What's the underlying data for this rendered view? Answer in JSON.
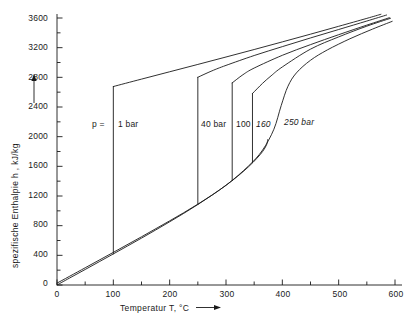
{
  "chart_data": {
    "type": "line",
    "title": "",
    "xlabel": "Temperatur T, °C",
    "ylabel": "spezifische Enthalpie  h , kJ/kg",
    "xlim": [
      0,
      600
    ],
    "ylim": [
      0,
      3600
    ],
    "grid": false,
    "legend_position": "inline-annotations",
    "x_ticks": [
      "0",
      "100",
      "200",
      "300",
      "400",
      "500",
      "600"
    ],
    "x_tick_values": [
      0,
      100,
      200,
      300,
      400,
      500,
      600
    ],
    "x_minor_tick_values": [
      50,
      150,
      250,
      350,
      450,
      550
    ],
    "y_ticks": [
      "0",
      "400",
      "800",
      "1200",
      "1600",
      "2000",
      "2400",
      "2800",
      "3200",
      "3600"
    ],
    "y_tick_values": [
      0,
      400,
      800,
      1200,
      1600,
      2000,
      2400,
      2800,
      3200,
      3600
    ],
    "y_minor_tick_values": [
      200,
      600,
      1000,
      1400,
      1800,
      2200,
      2600,
      3000,
      3400
    ],
    "annotations": [
      {
        "name": "p-equals-label",
        "text": "p =",
        "x": 70,
        "y": 2180
      },
      {
        "name": "isobar-label-1bar",
        "text": "1 bar",
        "x": 120,
        "y": 2180
      },
      {
        "name": "isobar-label-40bar",
        "text": "40 bar",
        "x": 258,
        "y": 2180
      },
      {
        "name": "isobar-label-100bar",
        "text": "100",
        "x": 312,
        "y": 2180
      },
      {
        "name": "isobar-label-160bar",
        "text": "160",
        "x": 345,
        "y": 2180
      },
      {
        "name": "isobar-label-250bar",
        "text": "250 bar",
        "x": 392,
        "y": 2180
      }
    ],
    "series": [
      {
        "name": "saturated liquid line (Siedelinie)",
        "pressure_bar": null,
        "points": [
          [
            0,
            0
          ],
          [
            25,
            105
          ],
          [
            50,
            209
          ],
          [
            75,
            314
          ],
          [
            100,
            419
          ],
          [
            125,
            525
          ],
          [
            150,
            632
          ],
          [
            175,
            741
          ],
          [
            200,
            852
          ],
          [
            225,
            966
          ],
          [
            250,
            1085
          ],
          [
            275,
            1210
          ],
          [
            300,
            1344
          ],
          [
            320,
            1462
          ],
          [
            340,
            1594
          ],
          [
            355,
            1710
          ],
          [
            365,
            1800
          ],
          [
            372,
            1890
          ],
          [
            374,
            1960
          ]
        ]
      },
      {
        "name": "isobar 1 bar (superheated vapour)",
        "pressure_bar": 1,
        "points": [
          [
            100,
            2676
          ],
          [
            150,
            2776
          ],
          [
            200,
            2875
          ],
          [
            250,
            2974
          ],
          [
            300,
            3074
          ],
          [
            350,
            3175
          ],
          [
            400,
            3278
          ],
          [
            450,
            3382
          ],
          [
            500,
            3488
          ],
          [
            550,
            3595
          ],
          [
            575,
            3650
          ]
        ]
      },
      {
        "name": "isobar 1 bar (evaporation, vertical)",
        "pressure_bar": 1,
        "points": [
          [
            100,
            419
          ],
          [
            100,
            2676
          ]
        ]
      },
      {
        "name": "isobar 40 bar (superheated vapour)",
        "pressure_bar": 40,
        "points": [
          [
            250,
            2801
          ],
          [
            275,
            2887
          ],
          [
            300,
            2961
          ],
          [
            350,
            3094
          ],
          [
            400,
            3214
          ],
          [
            450,
            3331
          ],
          [
            500,
            3445
          ],
          [
            550,
            3559
          ],
          [
            585,
            3640
          ]
        ]
      },
      {
        "name": "isobar 40 bar (evaporation, vertical)",
        "pressure_bar": 40,
        "points": [
          [
            250,
            1087
          ],
          [
            250,
            2801
          ]
        ]
      },
      {
        "name": "isobar 100 bar (superheated vapour)",
        "pressure_bar": 100,
        "points": [
          [
            311,
            2725
          ],
          [
            330,
            2835
          ],
          [
            350,
            2925
          ],
          [
            400,
            3097
          ],
          [
            450,
            3241
          ],
          [
            500,
            3375
          ],
          [
            550,
            3504
          ],
          [
            590,
            3604
          ]
        ]
      },
      {
        "name": "isobar 100 bar (evaporation, vertical)",
        "pressure_bar": 100,
        "points": [
          [
            311,
            1408
          ],
          [
            311,
            2725
          ]
        ]
      },
      {
        "name": "isobar 160 bar (superheated vapour)",
        "pressure_bar": 160,
        "points": [
          [
            347,
            2582
          ],
          [
            365,
            2720
          ],
          [
            380,
            2820
          ],
          [
            400,
            2940
          ],
          [
            450,
            3180
          ],
          [
            500,
            3345
          ],
          [
            550,
            3490
          ],
          [
            592,
            3596
          ]
        ]
      },
      {
        "name": "isobar 160 bar (evaporation, vertical)",
        "pressure_bar": 160,
        "points": [
          [
            347,
            1650
          ],
          [
            347,
            2582
          ]
        ]
      },
      {
        "name": "isobar 250 bar (supercritical)",
        "pressure_bar": 250,
        "points": [
          [
            0,
            25
          ],
          [
            50,
            232
          ],
          [
            100,
            440
          ],
          [
            150,
            650
          ],
          [
            200,
            865
          ],
          [
            250,
            1090
          ],
          [
            300,
            1345
          ],
          [
            340,
            1605
          ],
          [
            365,
            1820
          ],
          [
            385,
            2100
          ],
          [
            398,
            2420
          ],
          [
            410,
            2680
          ],
          [
            425,
            2860
          ],
          [
            450,
            3030
          ],
          [
            480,
            3170
          ],
          [
            520,
            3320
          ],
          [
            560,
            3450
          ],
          [
            595,
            3555
          ]
        ]
      }
    ]
  },
  "axes": {
    "y_axis_arrow": "arrow-up",
    "x_axis_arrow": "arrow-right"
  }
}
